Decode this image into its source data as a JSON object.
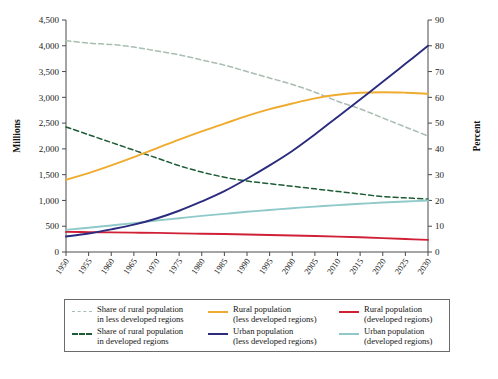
{
  "axes": {
    "left_title": "Millions",
    "right_title": "Percent",
    "left_ticks": [
      "0",
      "500",
      "1,000",
      "1,500",
      "2,000",
      "2,500",
      "3,000",
      "3,500",
      "4,000",
      "4,500"
    ],
    "right_ticks": [
      "0",
      "10",
      "20",
      "30",
      "40",
      "50",
      "60",
      "70",
      "80",
      "90"
    ],
    "x_ticks": [
      "1950",
      "1955",
      "1960",
      "1965",
      "1970",
      "1975",
      "1980",
      "1985",
      "1990",
      "1995",
      "2000",
      "2005",
      "2010",
      "2015",
      "2020",
      "2025",
      "2030"
    ]
  },
  "legend": {
    "entries": [
      {
        "label_line1": "Share of rural population",
        "label_line2": "in less developed regions",
        "color": "#a9bdb0",
        "style": "dashed",
        "axis": "right"
      },
      {
        "label_line1": "Rural population",
        "label_line2": "(less developed regions)",
        "color": "#efab2e",
        "style": "solid",
        "axis": "left"
      },
      {
        "label_line1": "Rural population",
        "label_line2": "(developed regions)",
        "color": "#cf2036",
        "style": "solid",
        "axis": "left"
      },
      {
        "label_line1": "Share of rural population",
        "label_line2": "in developed regions",
        "color": "#1d5c36",
        "style": "dashed",
        "axis": "right"
      },
      {
        "label_line1": "Urban population",
        "label_line2": "(less developed regions)",
        "color": "#2b2b7f",
        "style": "solid",
        "axis": "left"
      },
      {
        "label_line1": "Urban population",
        "label_line2": "(developed regions)",
        "color": "#8fc9c9",
        "style": "solid",
        "axis": "left"
      }
    ]
  },
  "caption": {
    "text": ""
  },
  "chart_data": {
    "type": "line",
    "title": "",
    "xlabel": "",
    "ylabel": "Millions",
    "y2label": "Percent",
    "grid": false,
    "legend_position": "bottom",
    "x": [
      1950,
      1955,
      1960,
      1965,
      1970,
      1975,
      1980,
      1985,
      1990,
      1995,
      2000,
      2005,
      2010,
      2015,
      2020,
      2025,
      2030
    ],
    "xlim": [
      1950,
      2030
    ],
    "ylim": [
      0,
      4500
    ],
    "y2lim": [
      0,
      90
    ],
    "series": [
      {
        "name": "Share of rural population in less developed regions",
        "axis": "right",
        "unit": "percent",
        "color": "#a9bdb0",
        "style": "dashed",
        "values": [
          82,
          81,
          80.5,
          79.5,
          78,
          76.5,
          74.5,
          72.5,
          70,
          67.5,
          65,
          62,
          58.5,
          55.5,
          52,
          48.5,
          45
        ]
      },
      {
        "name": "Share of rural population in developed regions",
        "axis": "right",
        "unit": "percent",
        "color": "#1d5c36",
        "style": "dashed",
        "values": [
          48.5,
          45.5,
          42.5,
          39.5,
          36.5,
          33.5,
          31,
          29,
          27.5,
          26.5,
          25.5,
          24.5,
          23.5,
          22.5,
          21.5,
          21,
          20.5
        ]
      },
      {
        "name": "Rural population (less developed regions)",
        "axis": "left",
        "unit": "millions",
        "color": "#efab2e",
        "values": [
          1400,
          1530,
          1680,
          1840,
          2010,
          2180,
          2340,
          2490,
          2640,
          2770,
          2880,
          2980,
          3050,
          3090,
          3100,
          3090,
          3070
        ]
      },
      {
        "name": "Rural population (developed regions)",
        "axis": "left",
        "unit": "millions",
        "color": "#cf2036",
        "values": [
          390,
          385,
          380,
          375,
          370,
          362,
          355,
          348,
          340,
          330,
          320,
          310,
          298,
          285,
          270,
          252,
          235
        ]
      },
      {
        "name": "Urban population (less developed regions)",
        "axis": "left",
        "unit": "millions",
        "color": "#2b2b7f",
        "values": [
          300,
          360,
          440,
          530,
          650,
          800,
          980,
          1180,
          1420,
          1680,
          1960,
          2280,
          2620,
          2960,
          3300,
          3650,
          4000
        ]
      },
      {
        "name": "Urban population (developed regions)",
        "axis": "left",
        "unit": "millions",
        "color": "#8fc9c9",
        "values": [
          430,
          470,
          515,
          560,
          610,
          655,
          700,
          740,
          780,
          815,
          850,
          880,
          910,
          935,
          960,
          980,
          1000
        ]
      }
    ]
  }
}
